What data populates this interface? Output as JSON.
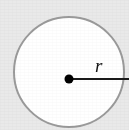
{
  "figure": {
    "kind": "geometry-diagram",
    "background_color": "#e9e9e9",
    "circle": {
      "name": "circle-shape",
      "fill_color": "#ffffff",
      "stroke_color": "#9a9a9a",
      "stroke_width": 2,
      "center_x": 69,
      "center_y": 72,
      "radius": 55
    },
    "center_point": {
      "name": "center-dot",
      "color": "#000000",
      "x": 69,
      "y": 79,
      "radius": 4.5
    },
    "radius_line": {
      "name": "radius-line",
      "color": "#1a1a1a",
      "stroke_width": 2,
      "x1": 69,
      "y1": 79,
      "x2": 129,
      "y2": 79
    },
    "radius_label": {
      "name": "radius-label",
      "text": "r",
      "x": 95,
      "y": 72,
      "color": "#141414",
      "style": "italic"
    }
  }
}
